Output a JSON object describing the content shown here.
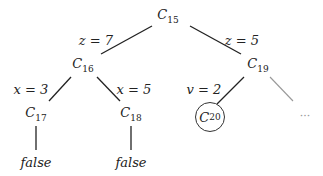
{
  "nodes": {
    "c15": {
      "base": "C",
      "sub": "15"
    },
    "c16": {
      "base": "C",
      "sub": "16"
    },
    "c19": {
      "base": "C",
      "sub": "19"
    },
    "c17": {
      "base": "C",
      "sub": "17"
    },
    "c18": {
      "base": "C",
      "sub": "18"
    },
    "c20": {
      "base": "C",
      "sub": "20"
    }
  },
  "edges": {
    "c15_c16": "z = 7",
    "c15_c19": "z = 5",
    "c16_c17": "x = 3",
    "c16_c18": "x = 5",
    "c19_c20": "v = 2"
  },
  "leaves": {
    "c17_leaf": "false",
    "c18_leaf": "false"
  },
  "ellipsis": "···",
  "colors": {
    "edge": "#222222",
    "faded_edge": "#999999"
  }
}
